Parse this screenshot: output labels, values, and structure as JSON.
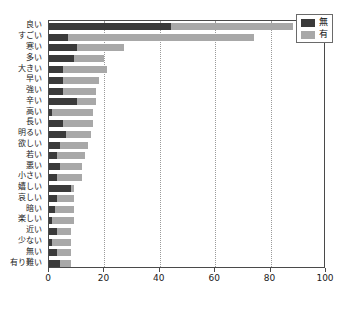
{
  "chart_data": {
    "type": "bar",
    "orientation": "horizontal",
    "stacked": true,
    "title": "",
    "xlabel": "",
    "ylabel": "",
    "xlim": [
      0,
      100
    ],
    "xticks": [
      0,
      20,
      40,
      60,
      80,
      100
    ],
    "grid": true,
    "grid_axis": "x",
    "legend_position": "top-right",
    "categories": [
      "良い",
      "すごい",
      "寒い",
      "多い",
      "大きい",
      "早い",
      "強い",
      "辛い",
      "高い",
      "長い",
      "明るい",
      "欲しい",
      "若い",
      "悪い",
      "小さい",
      "嬉しい",
      "哀しい",
      "暗い",
      "楽しい",
      "近い",
      "少ない",
      "無い",
      "有り難い"
    ],
    "series": [
      {
        "name": "無",
        "color": "#3a3a3a",
        "values": [
          44,
          7,
          10,
          9,
          5,
          5,
          5,
          10,
          1,
          5,
          6,
          4,
          3,
          4,
          3,
          8,
          3,
          2,
          1,
          3,
          1,
          3,
          4
        ]
      },
      {
        "name": "有",
        "color": "#a8a8a8",
        "values": [
          44,
          67,
          17,
          11,
          16,
          13,
          12,
          7,
          15,
          11,
          9,
          10,
          10,
          8,
          9,
          1,
          6,
          7,
          8,
          5,
          7,
          5,
          4
        ]
      }
    ],
    "totals": [
      88,
      74,
      27,
      20,
      21,
      18,
      17,
      17,
      16,
      16,
      15,
      14,
      13,
      12,
      12,
      9,
      9,
      9,
      9,
      8,
      8,
      8,
      8
    ]
  },
  "legend": {
    "items": [
      {
        "label": "無",
        "color": "#3a3a3a"
      },
      {
        "label": "有",
        "color": "#a8a8a8"
      }
    ]
  }
}
